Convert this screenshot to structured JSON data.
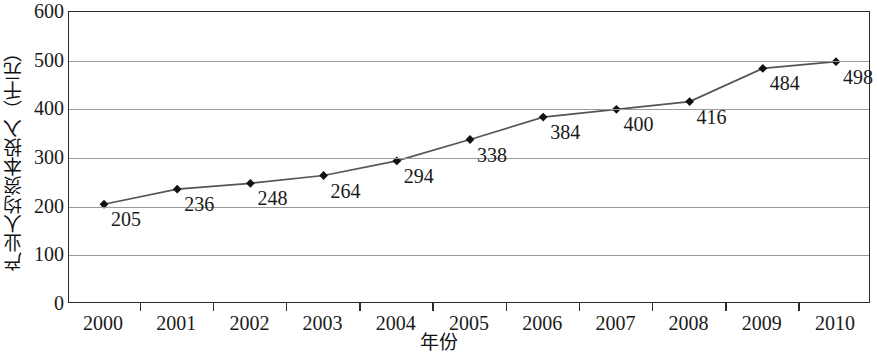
{
  "chart_data": {
    "type": "line",
    "title": "",
    "xlabel": "年份",
    "ylabel": "产业人均资本投入（千元）",
    "categories": [
      "2000",
      "2001",
      "2002",
      "2003",
      "2004",
      "2005",
      "2006",
      "2007",
      "2008",
      "2009",
      "2010"
    ],
    "values": [
      205,
      236,
      248,
      264,
      294,
      338,
      384,
      400,
      416,
      484,
      498
    ],
    "data_labels": [
      "205",
      "236",
      "248",
      "264",
      "294",
      "338",
      "384",
      "400",
      "416",
      "484",
      "498"
    ],
    "ylim": [
      0,
      600
    ],
    "ytick_values": [
      0,
      100,
      200,
      300,
      400,
      500,
      600
    ],
    "ytick_labels": [
      "0",
      "100",
      "200",
      "300",
      "400",
      "500",
      "600"
    ],
    "grid": true,
    "legend": "none",
    "series": [
      {
        "name": "产业人均资本投入",
        "values": [
          205,
          236,
          248,
          264,
          294,
          338,
          384,
          400,
          416,
          484,
          498
        ],
        "marker": "diamond",
        "line_color": "#555555",
        "marker_color": "#111111"
      }
    ],
    "colors": {
      "line": "#555555",
      "marker": "#111111",
      "gridline": "#9a9a9a",
      "axis_border": "#2b2b2b",
      "text": "#1a1a1a",
      "background": "#ffffff"
    }
  }
}
